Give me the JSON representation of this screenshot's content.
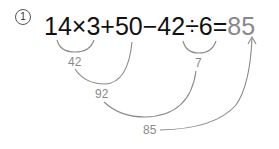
{
  "problem": {
    "number": "1",
    "expression": "14×3+50−42÷6=",
    "answer": "85"
  },
  "steps": [
    {
      "label": "42",
      "desc": "14×3"
    },
    {
      "label": "7",
      "desc": "42÷6"
    },
    {
      "label": "92",
      "desc": "42+50"
    },
    {
      "label": "85",
      "desc": "92−7"
    }
  ],
  "colors": {
    "expression": "#111111",
    "annotation": "#8a8a8a"
  }
}
